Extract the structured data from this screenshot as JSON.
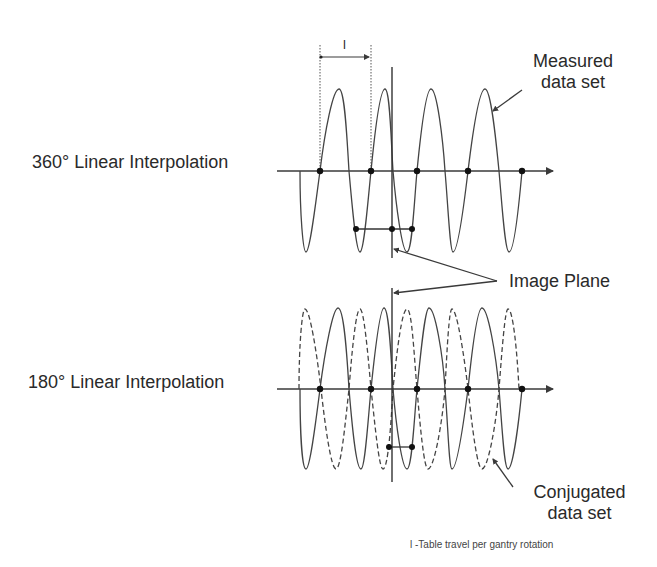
{
  "labels": {
    "top_row": "360° Linear Interpolation",
    "bottom_row": "180° Linear Interpolation",
    "measured_line1": "Measured",
    "measured_line2": "data set",
    "image_plane": "Image Plane",
    "conjugated_line1": "Conjugated",
    "conjugated_line2": "data set",
    "dimension_symbol": "l",
    "footnote": "l -Table travel per gantry rotation"
  },
  "style": {
    "line_color": "#3a3a3a",
    "dot_color": "#111111",
    "background": "#ffffff"
  },
  "panels": [
    {
      "id": "360",
      "axis_y": 171,
      "axis_x_start": 277,
      "axis_x_end": 553,
      "sample_points_x": [
        320,
        371,
        417,
        468,
        522
      ],
      "interpolation_bar": {
        "y": 229,
        "points_x": [
          356,
          392,
          412
        ]
      },
      "image_plane": {
        "x": 392,
        "y_top": 67,
        "y_bottom": 258
      },
      "series": [
        {
          "name": "Measured data set",
          "style": "solid",
          "peaks": [
            [
              339,
              89
            ],
            [
              385,
              89
            ],
            [
              431,
              89
            ],
            [
              485,
              89
            ]
          ],
          "troughs": [
            [
              306,
              252
            ],
            [
              360,
              252
            ],
            [
              407,
              252
            ],
            [
              453,
              252
            ],
            [
              509,
              252
            ]
          ]
        }
      ]
    },
    {
      "id": "180",
      "axis_y": 389,
      "axis_x_start": 277,
      "axis_x_end": 553,
      "sample_points_x": [
        320,
        371,
        417,
        468,
        522
      ],
      "interpolation_bar": {
        "y": 447,
        "points_x": [
          389,
          412
        ]
      },
      "image_plane": {
        "x": 392,
        "y_top": 288,
        "y_bottom": 482
      },
      "series": [
        {
          "name": "Measured data set",
          "style": "solid",
          "peaks": [
            [
              338,
              308
            ],
            [
              384,
              308
            ],
            [
              429,
              308
            ],
            [
              482,
              308
            ]
          ],
          "troughs": [
            [
              306,
              469
            ],
            [
              360,
              469
            ],
            [
              407,
              469
            ],
            [
              452,
              469
            ],
            [
              508,
              469
            ]
          ]
        },
        {
          "name": "Conjugated data set",
          "style": "dashed",
          "peaks": [
            [
              305,
              309
            ],
            [
              360,
              309
            ],
            [
              407,
              309
            ],
            [
              452,
              309
            ],
            [
              508,
              309
            ]
          ],
          "troughs": [
            [
              336,
              469
            ],
            [
              383,
              469
            ],
            [
              428,
              469
            ],
            [
              482,
              469
            ]
          ]
        }
      ]
    }
  ],
  "dimension": {
    "x1": 320,
    "x2": 371,
    "y": 57,
    "guide_top": 45
  }
}
